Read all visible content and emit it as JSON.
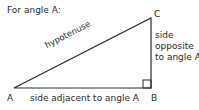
{
  "title": "For angle A:",
  "vertices": {
    "A": "A",
    "B": "B",
    "C": "C"
  },
  "sides": {
    "hypotenuse": "hypotenuse",
    "opposite_line1": "side",
    "opposite_line2": "opposite",
    "opposite_line3": "to angle A",
    "adjacent": "side adjacent to angle A"
  },
  "colors": {
    "line": "#2a2a2a",
    "text": "#2a2a2a",
    "background": "#ffffff"
  }
}
